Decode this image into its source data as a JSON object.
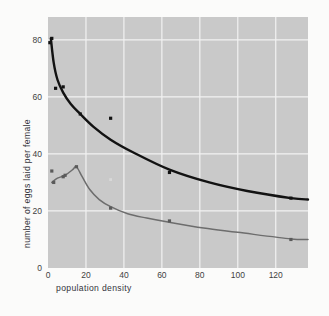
{
  "chart_data": {
    "type": "line",
    "title": "",
    "xlabel": "population density",
    "ylabel": "number of eggs laid per female",
    "xlim": [
      0,
      137
    ],
    "ylim": [
      0,
      88
    ],
    "xticks": [
      0,
      20,
      40,
      60,
      80,
      100,
      120
    ],
    "yticks": [
      0,
      20,
      40,
      60,
      80
    ],
    "grid": true,
    "legend": "none",
    "panel_color": "#c9c9c9",
    "grid_color": "#f2f2f2",
    "series": [
      {
        "name": "upper-curve",
        "color": "#121212",
        "marker_color": "#121212",
        "points": [
          {
            "x": 1,
            "y": 79
          },
          {
            "x": 2,
            "y": 80.5
          },
          {
            "x": 4,
            "y": 63
          },
          {
            "x": 8,
            "y": 63.5
          },
          {
            "x": 17,
            "y": 54
          },
          {
            "x": 33,
            "y": 52.5
          },
          {
            "x": 64,
            "y": 33.5
          },
          {
            "x": 128,
            "y": 24.5
          }
        ],
        "fit_points": [
          {
            "x": 1.5,
            "y": 80.5
          },
          {
            "x": 3,
            "y": 72
          },
          {
            "x": 5,
            "y": 66
          },
          {
            "x": 8,
            "y": 61.5
          },
          {
            "x": 12,
            "y": 57.5
          },
          {
            "x": 17,
            "y": 54
          },
          {
            "x": 24,
            "y": 49.5
          },
          {
            "x": 33,
            "y": 45
          },
          {
            "x": 45,
            "y": 40.5
          },
          {
            "x": 64,
            "y": 34.5
          },
          {
            "x": 85,
            "y": 30
          },
          {
            "x": 105,
            "y": 27
          },
          {
            "x": 128,
            "y": 24.5
          },
          {
            "x": 137,
            "y": 24
          }
        ]
      },
      {
        "name": "lower-curve",
        "color": "#6d6d6d",
        "marker_color": "#5a5a5a",
        "points": [
          {
            "x": 2,
            "y": 34
          },
          {
            "x": 3,
            "y": 30
          },
          {
            "x": 8,
            "y": 32
          },
          {
            "x": 9,
            "y": 32.5
          },
          {
            "x": 15,
            "y": 35.5
          },
          {
            "x": 33,
            "y": 21
          },
          {
            "x": 64,
            "y": 16.5
          },
          {
            "x": 128,
            "y": 10
          }
        ],
        "fit_points": [
          {
            "x": 2,
            "y": 30
          },
          {
            "x": 5,
            "y": 31.5
          },
          {
            "x": 9,
            "y": 32.5
          },
          {
            "x": 13,
            "y": 34.5
          },
          {
            "x": 15,
            "y": 35.5
          },
          {
            "x": 18,
            "y": 32
          },
          {
            "x": 22,
            "y": 27.5
          },
          {
            "x": 27,
            "y": 24
          },
          {
            "x": 33,
            "y": 21.5
          },
          {
            "x": 42,
            "y": 19
          },
          {
            "x": 52,
            "y": 17.5
          },
          {
            "x": 64,
            "y": 16
          },
          {
            "x": 82,
            "y": 14
          },
          {
            "x": 100,
            "y": 12.5
          },
          {
            "x": 128,
            "y": 10.2
          },
          {
            "x": 137,
            "y": 10
          }
        ]
      }
    ],
    "stray_points": [
      {
        "x": 33,
        "y": 31,
        "color": "#d9d9d9",
        "name": "faint-speck"
      }
    ]
  }
}
